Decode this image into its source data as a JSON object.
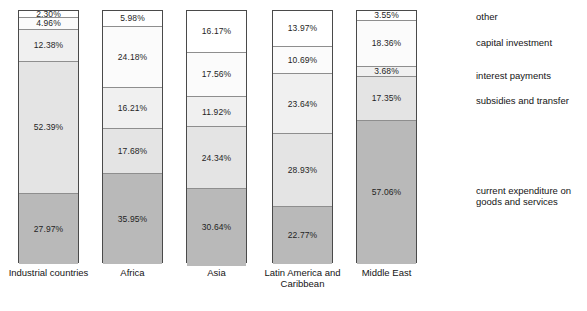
{
  "chart_data": {
    "type": "bar",
    "subtype": "stacked-percentage",
    "title": "",
    "xlabel": "",
    "ylabel": "",
    "ylim": [
      0,
      100
    ],
    "grid": false,
    "legend_position": "right",
    "categories": [
      "Industrial countries",
      "Africa",
      "Asia",
      "Latin America and\nCaribbean",
      "Middle East"
    ],
    "series": [
      {
        "name": "current expenditure on\ngoods and services",
        "color": "#b9b9b9",
        "values": [
          52.39,
          35.95,
          30.64,
          22.77,
          57.06
        ]
      },
      {
        "name": "subsidies and transfer",
        "color": "#e4e4e4",
        "values": [
          27.97,
          17.68,
          24.34,
          28.93,
          17.35
        ]
      },
      {
        "name": "interest payments",
        "color": "#f0f0f0",
        "values": [
          12.38,
          16.21,
          11.92,
          23.64,
          3.68
        ]
      },
      {
        "name": "capital investment",
        "color": "#fbfbfb",
        "values": [
          4.96,
          24.18,
          17.56,
          10.69,
          18.36
        ]
      },
      {
        "name": "other",
        "color": "#ffffff",
        "values": [
          2.3,
          5.98,
          16.17,
          13.97,
          3.55
        ]
      }
    ],
    "bars": [
      {
        "category": "Industrial countries",
        "segments": [
          {
            "name": "other",
            "value": 2.3,
            "label": "2.30%"
          },
          {
            "name": "capital investment",
            "value": 4.96,
            "label": "4.96%"
          },
          {
            "name": "interest payments",
            "value": 12.38,
            "label": "12.38%"
          },
          {
            "name": "subsidies and transfer",
            "value": 52.39,
            "label": "52.39%"
          },
          {
            "name": "current expenditure on goods and services",
            "value": 27.97,
            "label": "27.97%"
          }
        ]
      },
      {
        "category": "Africa",
        "segments": [
          {
            "name": "other",
            "value": 5.98,
            "label": "5.98%"
          },
          {
            "name": "capital investment",
            "value": 24.18,
            "label": "24.18%"
          },
          {
            "name": "interest payments",
            "value": 16.21,
            "label": "16.21%"
          },
          {
            "name": "subsidies and transfer",
            "value": 17.68,
            "label": "17.68%"
          },
          {
            "name": "current expenditure on goods and services",
            "value": 35.95,
            "label": "35.95%"
          }
        ]
      },
      {
        "category": "Asia",
        "segments": [
          {
            "name": "other",
            "value": 16.17,
            "label": "16.17%"
          },
          {
            "name": "capital investment",
            "value": 17.56,
            "label": "17.56%"
          },
          {
            "name": "interest payments",
            "value": 11.92,
            "label": "11.92%"
          },
          {
            "name": "subsidies and transfer",
            "value": 24.34,
            "label": "24.34%"
          },
          {
            "name": "current expenditure on goods and services",
            "value": 30.64,
            "label": "30.64%"
          }
        ]
      },
      {
        "category": "Latin America and Caribbean",
        "segments": [
          {
            "name": "other",
            "value": 13.97,
            "label": "13.97%"
          },
          {
            "name": "capital investment",
            "value": 10.69,
            "label": "10.69%"
          },
          {
            "name": "interest payments",
            "value": 23.64,
            "label": "23.64%"
          },
          {
            "name": "subsidies and transfer",
            "value": 28.93,
            "label": "28.93%"
          },
          {
            "name": "current expenditure on goods and services",
            "value": 22.77,
            "label": "22.77%"
          }
        ]
      },
      {
        "category": "Middle East",
        "segments": [
          {
            "name": "other",
            "value": 3.55,
            "label": "3.55%"
          },
          {
            "name": "capital investment",
            "value": 18.36,
            "label": "18.36%"
          },
          {
            "name": "interest payments",
            "value": 3.68,
            "label": "3.68%"
          },
          {
            "name": "subsidies and transfer",
            "value": 17.35,
            "label": "17.35%"
          },
          {
            "name": "current expenditure on goods and services",
            "value": 57.06,
            "label": "57.06%"
          }
        ]
      }
    ],
    "legend": [
      {
        "label": "other",
        "color": "#ffffff"
      },
      {
        "label": "capital investment",
        "color": "#fbfbfb"
      },
      {
        "label": "interest payments",
        "color": "#f0f0f0"
      },
      {
        "label": "subsidies and transfer",
        "color": "#e4e4e4"
      },
      {
        "label": "current expenditure on\ngoods and services",
        "color": "#b9b9b9"
      }
    ]
  },
  "layout": {
    "bar_x": [
      18,
      102,
      186,
      272,
      356
    ],
    "bar_width": 61,
    "legend_y": [
      11,
      37,
      70,
      95,
      185
    ],
    "segment_classes": [
      "c-other",
      "c-capital",
      "c-interest",
      "c-subsidy",
      "c-current"
    ]
  }
}
